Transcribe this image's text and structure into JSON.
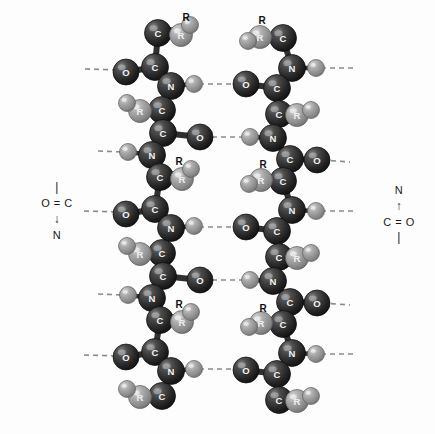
{
  "figure": {
    "background_color": "#fdfdfd",
    "atom_colors": {
      "carbon": "#2b2b2b",
      "nitrogen": "#3a3a3a",
      "oxygen": "#333333",
      "hydrogen": "#9a9a9a",
      "r_group": "#8e8e8e",
      "bond": "#2f2f2f",
      "hydrogen_bond": "#8a8a8a"
    }
  },
  "legend_left": {
    "top_bond": "|",
    "row": "O = C",
    "arrow": "↓",
    "bottom": "N"
  },
  "legend_right": {
    "top": "N",
    "arrow": "↑",
    "row": "C = O",
    "bottom_bond": "|"
  },
  "labels": {
    "carbon": "C",
    "nitrogen": "N",
    "oxygen": "O",
    "r_group": "R",
    "hydrogen": ""
  },
  "chain_left": {
    "name": "polypeptide-chain-left",
    "direction": "N-terminus top",
    "atoms": [
      {
        "id": "L-C1",
        "el": "C",
        "x": 158,
        "y": 33
      },
      {
        "id": "L-R1",
        "el": "R",
        "x": 181,
        "y": 35
      },
      {
        "id": "L-H1",
        "el": "H",
        "x": 190,
        "y": 25
      },
      {
        "id": "L-C2",
        "el": "C",
        "x": 155,
        "y": 67
      },
      {
        "id": "L-O1",
        "el": "O",
        "x": 126,
        "y": 72
      },
      {
        "id": "L-N1",
        "el": "N",
        "x": 171,
        "y": 86
      },
      {
        "id": "L-H2",
        "el": "H",
        "x": 194,
        "y": 84
      },
      {
        "id": "L-C3",
        "el": "C",
        "x": 162,
        "y": 110
      },
      {
        "id": "L-R2",
        "el": "R",
        "x": 140,
        "y": 111
      },
      {
        "id": "L-H3",
        "el": "H",
        "x": 127,
        "y": 103
      },
      {
        "id": "L-C4",
        "el": "C",
        "x": 163,
        "y": 133
      },
      {
        "id": "L-O2",
        "el": "O",
        "x": 200,
        "y": 137
      },
      {
        "id": "L-N2",
        "el": "N",
        "x": 152,
        "y": 155
      },
      {
        "id": "L-H4",
        "el": "H",
        "x": 128,
        "y": 152
      },
      {
        "id": "L-C5",
        "el": "C",
        "x": 160,
        "y": 177
      },
      {
        "id": "L-R3",
        "el": "R",
        "x": 182,
        "y": 179
      },
      {
        "id": "L-H5",
        "el": "H",
        "x": 191,
        "y": 169
      },
      {
        "id": "L-C6",
        "el": "C",
        "x": 155,
        "y": 209
      },
      {
        "id": "L-O3",
        "el": "O",
        "x": 126,
        "y": 214
      },
      {
        "id": "L-N3",
        "el": "N",
        "x": 171,
        "y": 228
      },
      {
        "id": "L-H6",
        "el": "H",
        "x": 194,
        "y": 226
      },
      {
        "id": "L-C7",
        "el": "C",
        "x": 162,
        "y": 253
      },
      {
        "id": "L-R4",
        "el": "R",
        "x": 140,
        "y": 254
      },
      {
        "id": "L-H7",
        "el": "H",
        "x": 127,
        "y": 246
      },
      {
        "id": "L-C8",
        "el": "C",
        "x": 163,
        "y": 276
      },
      {
        "id": "L-O4",
        "el": "O",
        "x": 200,
        "y": 280
      },
      {
        "id": "L-N4",
        "el": "N",
        "x": 152,
        "y": 298
      },
      {
        "id": "L-H8",
        "el": "H",
        "x": 128,
        "y": 295
      },
      {
        "id": "L-C9",
        "el": "C",
        "x": 160,
        "y": 320
      },
      {
        "id": "L-R5",
        "el": "R",
        "x": 182,
        "y": 322
      },
      {
        "id": "L-H9",
        "el": "H",
        "x": 191,
        "y": 312
      },
      {
        "id": "L-C10",
        "el": "C",
        "x": 155,
        "y": 352
      },
      {
        "id": "L-O5",
        "el": "O",
        "x": 126,
        "y": 357
      },
      {
        "id": "L-N5",
        "el": "N",
        "x": 171,
        "y": 371
      },
      {
        "id": "L-H10",
        "el": "H",
        "x": 194,
        "y": 369
      },
      {
        "id": "L-C11",
        "el": "C",
        "x": 162,
        "y": 396
      },
      {
        "id": "L-R6",
        "el": "R",
        "x": 140,
        "y": 397
      },
      {
        "id": "L-H11",
        "el": "H",
        "x": 127,
        "y": 389
      }
    ],
    "bonds": [
      [
        "L-C1",
        "L-R1"
      ],
      [
        "L-C1",
        "L-H1"
      ],
      [
        "L-C1",
        "L-C2"
      ],
      [
        "L-C2",
        "L-O1"
      ],
      [
        "L-C2",
        "L-N1"
      ],
      [
        "L-N1",
        "L-H2"
      ],
      [
        "L-N1",
        "L-C3"
      ],
      [
        "L-C3",
        "L-R2"
      ],
      [
        "L-R2",
        "L-H3"
      ],
      [
        "L-C3",
        "L-C4"
      ],
      [
        "L-C4",
        "L-O2"
      ],
      [
        "L-C4",
        "L-N2"
      ],
      [
        "L-N2",
        "L-H4"
      ],
      [
        "L-N2",
        "L-C5"
      ],
      [
        "L-C5",
        "L-R3"
      ],
      [
        "L-C5",
        "L-H5"
      ],
      [
        "L-C5",
        "L-C6"
      ],
      [
        "L-C6",
        "L-O3"
      ],
      [
        "L-C6",
        "L-N3"
      ],
      [
        "L-N3",
        "L-H6"
      ],
      [
        "L-N3",
        "L-C7"
      ],
      [
        "L-C7",
        "L-R4"
      ],
      [
        "L-R4",
        "L-H7"
      ],
      [
        "L-C7",
        "L-C8"
      ],
      [
        "L-C8",
        "L-O4"
      ],
      [
        "L-C8",
        "L-N4"
      ],
      [
        "L-N4",
        "L-H8"
      ],
      [
        "L-N4",
        "L-C9"
      ],
      [
        "L-C9",
        "L-R5"
      ],
      [
        "L-C9",
        "L-H9"
      ],
      [
        "L-C9",
        "L-C10"
      ],
      [
        "L-C10",
        "L-O5"
      ],
      [
        "L-C10",
        "L-N5"
      ],
      [
        "L-N5",
        "L-H10"
      ],
      [
        "L-N5",
        "L-C11"
      ],
      [
        "L-C11",
        "L-R6"
      ],
      [
        "L-R6",
        "L-H11"
      ]
    ]
  },
  "chain_right": {
    "name": "polypeptide-chain-right",
    "direction": "N-terminus bottom (antiparallel)",
    "atoms": [
      {
        "id": "R-C1",
        "el": "C",
        "x": 283,
        "y": 38
      },
      {
        "id": "R-R1",
        "el": "R",
        "x": 260,
        "y": 37
      },
      {
        "id": "R-H1",
        "el": "H",
        "x": 248,
        "y": 41
      },
      {
        "id": "R-N1",
        "el": "N",
        "x": 292,
        "y": 68
      },
      {
        "id": "R-H2",
        "el": "H",
        "x": 316,
        "y": 68
      },
      {
        "id": "R-C2",
        "el": "C",
        "x": 277,
        "y": 88
      },
      {
        "id": "R-O1",
        "el": "O",
        "x": 246,
        "y": 84
      },
      {
        "id": "R-C3",
        "el": "C",
        "x": 279,
        "y": 114
      },
      {
        "id": "R-R2",
        "el": "R",
        "x": 297,
        "y": 115
      },
      {
        "id": "R-H3",
        "el": "H",
        "x": 311,
        "y": 110
      },
      {
        "id": "R-N2",
        "el": "N",
        "x": 273,
        "y": 138
      },
      {
        "id": "R-H4",
        "el": "H",
        "x": 250,
        "y": 137
      },
      {
        "id": "R-C4",
        "el": "C",
        "x": 290,
        "y": 159
      },
      {
        "id": "R-O2",
        "el": "O",
        "x": 317,
        "y": 160
      },
      {
        "id": "R-C5",
        "el": "C",
        "x": 283,
        "y": 181
      },
      {
        "id": "R-R3",
        "el": "R",
        "x": 261,
        "y": 180
      },
      {
        "id": "R-H5",
        "el": "H",
        "x": 249,
        "y": 184
      },
      {
        "id": "R-N3",
        "el": "N",
        "x": 292,
        "y": 210
      },
      {
        "id": "R-H6",
        "el": "H",
        "x": 316,
        "y": 211
      },
      {
        "id": "R-C6",
        "el": "C",
        "x": 277,
        "y": 231
      },
      {
        "id": "R-O3",
        "el": "O",
        "x": 246,
        "y": 227
      },
      {
        "id": "R-C7",
        "el": "C",
        "x": 279,
        "y": 257
      },
      {
        "id": "R-R4",
        "el": "R",
        "x": 297,
        "y": 258
      },
      {
        "id": "R-H7",
        "el": "H",
        "x": 311,
        "y": 253
      },
      {
        "id": "R-N4",
        "el": "N",
        "x": 273,
        "y": 281
      },
      {
        "id": "R-H8",
        "el": "H",
        "x": 250,
        "y": 280
      },
      {
        "id": "R-C8",
        "el": "C",
        "x": 290,
        "y": 302
      },
      {
        "id": "R-O4",
        "el": "O",
        "x": 317,
        "y": 303
      },
      {
        "id": "R-C9",
        "el": "C",
        "x": 283,
        "y": 324
      },
      {
        "id": "R-R5",
        "el": "R",
        "x": 261,
        "y": 323
      },
      {
        "id": "R-H9",
        "el": "H",
        "x": 249,
        "y": 327
      },
      {
        "id": "R-N5",
        "el": "N",
        "x": 292,
        "y": 353
      },
      {
        "id": "R-H10",
        "el": "H",
        "x": 316,
        "y": 354
      },
      {
        "id": "R-C10",
        "el": "C",
        "x": 277,
        "y": 374
      },
      {
        "id": "R-O5",
        "el": "O",
        "x": 246,
        "y": 370
      },
      {
        "id": "R-C11",
        "el": "C",
        "x": 279,
        "y": 400
      },
      {
        "id": "R-R6",
        "el": "R",
        "x": 297,
        "y": 401
      },
      {
        "id": "R-H11",
        "el": "H",
        "x": 311,
        "y": 396
      }
    ],
    "bonds": [
      [
        "R-C1",
        "R-R1"
      ],
      [
        "R-R1",
        "R-H1"
      ],
      [
        "R-C1",
        "R-N1"
      ],
      [
        "R-N1",
        "R-H2"
      ],
      [
        "R-N1",
        "R-C2"
      ],
      [
        "R-C2",
        "R-O1"
      ],
      [
        "R-C2",
        "R-C3"
      ],
      [
        "R-C3",
        "R-R2"
      ],
      [
        "R-R2",
        "R-H3"
      ],
      [
        "R-C3",
        "R-N2"
      ],
      [
        "R-N2",
        "R-H4"
      ],
      [
        "R-N2",
        "R-C4"
      ],
      [
        "R-C4",
        "R-O2"
      ],
      [
        "R-C4",
        "R-C5"
      ],
      [
        "R-C5",
        "R-R3"
      ],
      [
        "R-R3",
        "R-H5"
      ],
      [
        "R-C5",
        "R-N3"
      ],
      [
        "R-N3",
        "R-H6"
      ],
      [
        "R-N3",
        "R-C6"
      ],
      [
        "R-C6",
        "R-O3"
      ],
      [
        "R-C6",
        "R-C7"
      ],
      [
        "R-C7",
        "R-R4"
      ],
      [
        "R-R4",
        "R-H7"
      ],
      [
        "R-C7",
        "R-N4"
      ],
      [
        "R-N4",
        "R-H8"
      ],
      [
        "R-N4",
        "R-C8"
      ],
      [
        "R-C8",
        "R-O4"
      ],
      [
        "R-C8",
        "R-C9"
      ],
      [
        "R-C9",
        "R-R5"
      ],
      [
        "R-R5",
        "R-H9"
      ],
      [
        "R-C9",
        "R-N5"
      ],
      [
        "R-N5",
        "R-H10"
      ],
      [
        "R-N5",
        "R-C10"
      ],
      [
        "R-C10",
        "R-O5"
      ],
      [
        "R-C10",
        "R-C11"
      ],
      [
        "R-C11",
        "R-R6"
      ],
      [
        "R-R6",
        "R-H11"
      ]
    ]
  },
  "hydrogen_bonds": [
    {
      "id": "hb-edge-1",
      "x1": 85,
      "y1": 69,
      "x2": 120,
      "y2": 70
    },
    {
      "id": "hb-edge-2",
      "x1": 98,
      "y1": 151,
      "x2": 124,
      "y2": 152
    },
    {
      "id": "hb-edge-3",
      "x1": 84,
      "y1": 211,
      "x2": 120,
      "y2": 212
    },
    {
      "id": "hb-edge-4",
      "x1": 98,
      "y1": 294,
      "x2": 124,
      "y2": 295
    },
    {
      "id": "hb-edge-5",
      "x1": 84,
      "y1": 355,
      "x2": 120,
      "y2": 356
    },
    {
      "id": "hb-center-1",
      "x1": 199,
      "y1": 84,
      "x2": 242,
      "y2": 84
    },
    {
      "id": "hb-center-2",
      "x1": 203,
      "y1": 137,
      "x2": 246,
      "y2": 137
    },
    {
      "id": "hb-center-3",
      "x1": 199,
      "y1": 227,
      "x2": 242,
      "y2": 227
    },
    {
      "id": "hb-center-4",
      "x1": 203,
      "y1": 280,
      "x2": 246,
      "y2": 280
    },
    {
      "id": "hb-center-5",
      "x1": 199,
      "y1": 369,
      "x2": 242,
      "y2": 369
    },
    {
      "id": "hb-redge-1",
      "x1": 321,
      "y1": 68,
      "x2": 355,
      "y2": 68
    },
    {
      "id": "hb-redge-2",
      "x1": 322,
      "y1": 160,
      "x2": 350,
      "y2": 162
    },
    {
      "id": "hb-redge-3",
      "x1": 321,
      "y1": 211,
      "x2": 355,
      "y2": 211
    },
    {
      "id": "hb-redge-4",
      "x1": 322,
      "y1": 303,
      "x2": 350,
      "y2": 305
    },
    {
      "id": "hb-redge-5",
      "x1": 321,
      "y1": 354,
      "x2": 355,
      "y2": 354
    }
  ]
}
